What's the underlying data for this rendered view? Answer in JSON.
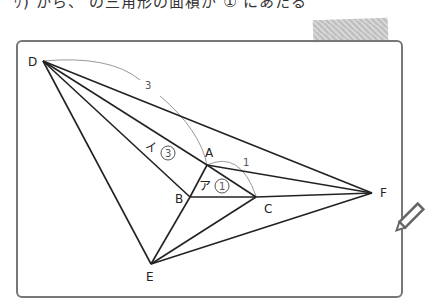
{
  "header": {
    "partial_text": "ｳ) から、 の三角形の面積が ① にあたる"
  },
  "diagram": {
    "points": {
      "D": {
        "label": "D",
        "x": 43,
        "y": 61
      },
      "A": {
        "label": "A",
        "x": 207,
        "y": 165
      },
      "B": {
        "label": "B",
        "x": 190,
        "y": 197
      },
      "C": {
        "label": "C",
        "x": 256,
        "y": 197
      },
      "E": {
        "label": "E",
        "x": 151,
        "y": 264
      },
      "F": {
        "label": "F",
        "x": 372,
        "y": 193
      }
    },
    "arc_labels": {
      "DA": "3",
      "AC": "1"
    },
    "region_labels": {
      "a": {
        "kana": "ア",
        "ratio": "1"
      },
      "i": {
        "kana": "イ",
        "ratio": "3"
      }
    }
  },
  "icons": {
    "pencil": "pencil-icon"
  }
}
